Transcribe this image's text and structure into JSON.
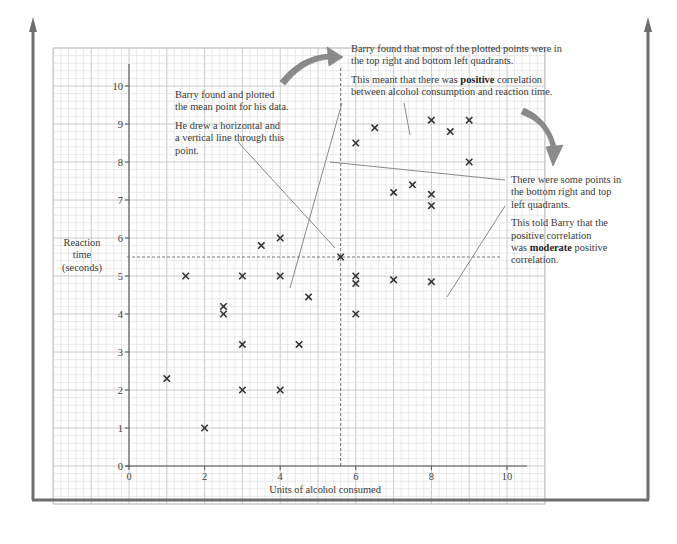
{
  "chart_data": {
    "type": "scatter",
    "title": "",
    "xlabel": "Units of alcohol consumed",
    "ylabel": "Reaction time (seconds)",
    "ylabel_lines": [
      "Reaction",
      "time",
      "(seconds)"
    ],
    "xlim": [
      0,
      10.5
    ],
    "ylim": [
      0,
      10.5
    ],
    "x_ticks": [
      0,
      2,
      4,
      6,
      8,
      10
    ],
    "y_ticks": [
      0,
      1,
      2,
      3,
      4,
      5,
      6,
      7,
      8,
      9,
      10
    ],
    "grid": true,
    "marker": "x",
    "points": [
      [
        1,
        2.3
      ],
      [
        1.5,
        5
      ],
      [
        2,
        1
      ],
      [
        2.5,
        4.2
      ],
      [
        2.5,
        4
      ],
      [
        3,
        5
      ],
      [
        3,
        3.2
      ],
      [
        3,
        2
      ],
      [
        3.5,
        5.8
      ],
      [
        4,
        6
      ],
      [
        4,
        5
      ],
      [
        4,
        2
      ],
      [
        4.5,
        3.2
      ],
      [
        4.75,
        4.45
      ],
      [
        6,
        8.5
      ],
      [
        6,
        5
      ],
      [
        6,
        4.8
      ],
      [
        6,
        4
      ],
      [
        6.5,
        8.9
      ],
      [
        7,
        7.2
      ],
      [
        7,
        4.9
      ],
      [
        7.5,
        7.4
      ],
      [
        8,
        9.1
      ],
      [
        8,
        7.15
      ],
      [
        8,
        6.85
      ],
      [
        8,
        4.85
      ],
      [
        8.5,
        8.8
      ],
      [
        9,
        9.1
      ],
      [
        9,
        8.0
      ]
    ],
    "mean_point": [
      5.6,
      5.5
    ],
    "mean_lines": {
      "horizontal_y": 5.5,
      "vertical_x": 5.6,
      "style": "dashed"
    },
    "annotations": [
      {
        "id": "mean",
        "paragraphs": [
          "Barry found and plotted the mean point for his data.",
          "He drew a horizontal and a vertical line through this point."
        ]
      },
      {
        "id": "quadrants",
        "paragraphs": [
          "Barry found that most of the plotted points were in the top right and bottom left quadrants.",
          "This meant that there was positive correlation between alcohol consumption and reaction time."
        ]
      },
      {
        "id": "moderate",
        "paragraphs": [
          "There were some points in the bottom right and top left quadrants.",
          "This told Barry that the positive correlation was moderate positive correlation."
        ]
      }
    ]
  },
  "notes": {
    "mean": {
      "p1_line1": "Barry found and plotted",
      "p1_line2": "the mean point for his data.",
      "p2_line1": "He drew a horizontal and",
      "p2_line2": "a vertical line through this",
      "p2_line3": "point."
    },
    "quadrants": {
      "p1_line1": "Barry found that most of the plotted points were in",
      "p1_line2": "the top right and bottom left quadrants.",
      "p2_pre": "This meant that there was ",
      "p2_bold": "positive",
      "p2_post": " correlation",
      "p2_line2": "between alcohol consumption and reaction time."
    },
    "moderate": {
      "p1_line1": "There were some points in",
      "p1_line2": "the bottom right and top",
      "p1_line3": "left quadrants.",
      "p2_line1": "This told Barry that the",
      "p2_line2": "positive correlation",
      "p2_pre": "was ",
      "p2_bold": "moderate",
      "p2_post": " positive",
      "p2_line4": "correlation."
    }
  },
  "colors": {
    "frame": "#6e6e6e",
    "grid_minor": "#dcdcdc",
    "grid_major": "#c4c4c4",
    "axis": "#555555",
    "marker": "#333333",
    "arrow_fill": "#8a8a8a",
    "leader": "#888888"
  }
}
